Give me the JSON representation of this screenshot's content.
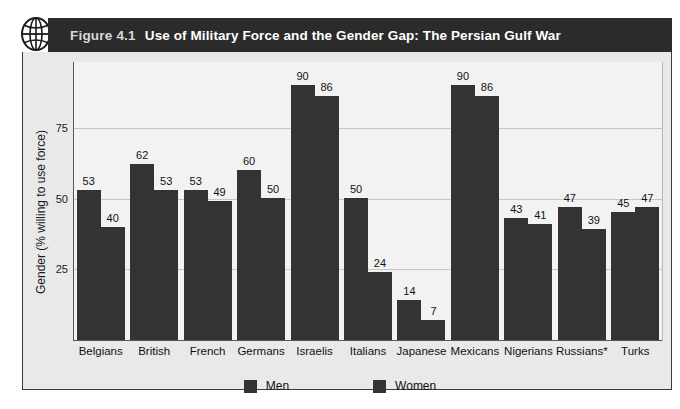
{
  "figure": {
    "icon": "globe-icon",
    "number": "Figure 4.1",
    "title": "Use of Military Force and the Gender Gap: The Persian Gulf War"
  },
  "colors": {
    "banner_bg": "#2b2b2b",
    "banner_number": "#d8d8d8",
    "banner_title": "#ffffff",
    "bar_men": "#333333",
    "bar_women": "#333333",
    "plot_bg": "#f2f2f2",
    "frame_bg": "#e9e9e9",
    "gridline": "#c6c6c6",
    "axis": "#555555"
  },
  "legend": {
    "position": "bottom-center",
    "items": [
      {
        "label": "Men",
        "color": "#333333"
      },
      {
        "label": "Women",
        "color": "#333333"
      }
    ]
  },
  "axes": {
    "y_label": "Gender (% willing to use force)",
    "y_ticks": [
      "25",
      "50",
      "75"
    ],
    "y_tick_values": [
      25,
      50,
      75
    ],
    "x_label": ""
  },
  "chart_data": {
    "type": "bar",
    "title": "Use of Military Force and the Gender Gap: The Persian Gulf War",
    "xlabel": "",
    "ylabel": "Gender (% willing to use force)",
    "ylim": [
      0,
      98
    ],
    "grid": true,
    "legend_position": "bottom-center",
    "categories": [
      "Belgians",
      "British",
      "French",
      "Germans",
      "Israelis",
      "Italians",
      "Japanese",
      "Mexicans",
      "Nigerians",
      "Russians*",
      "Turks"
    ],
    "series": [
      {
        "name": "Men",
        "values": [
          53,
          62,
          53,
          60,
          90,
          50,
          14,
          90,
          43,
          47,
          45
        ]
      },
      {
        "name": "Women",
        "values": [
          40,
          53,
          49,
          50,
          86,
          24,
          7,
          86,
          41,
          39,
          47
        ]
      }
    ]
  }
}
